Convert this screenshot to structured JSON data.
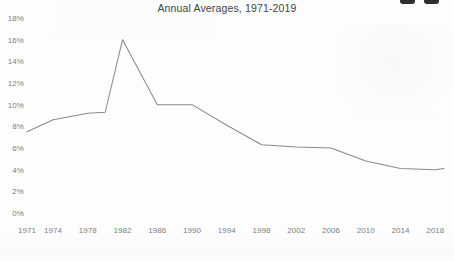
{
  "chart_data": {
    "type": "line",
    "title": "Annual Averages, 1971-2019",
    "xlabel": "",
    "ylabel": "",
    "ylim": [
      0,
      18
    ],
    "xlim": [
      1971,
      2019
    ],
    "grid": false,
    "legend": "none",
    "ytick_labels": [
      "0%",
      "2%",
      "4%",
      "6%",
      "8%",
      "10%",
      "12%",
      "14%",
      "16%",
      "18%"
    ],
    "ytick_values": [
      0,
      2,
      4,
      6,
      8,
      10,
      12,
      14,
      16,
      18
    ],
    "xtick_labels": [
      "1971",
      "1974",
      "1978",
      "1982",
      "1986",
      "1990",
      "1994",
      "1998",
      "2002",
      "2006",
      "2010",
      "2014",
      "2018"
    ],
    "xtick_values": [
      1971,
      1974,
      1978,
      1982,
      1986,
      1990,
      1994,
      1998,
      2002,
      2006,
      2010,
      2014,
      2018
    ],
    "series": [
      {
        "name": "Annual Average",
        "color": "#8a8a8a",
        "x": [
          1971,
          1974,
          1978,
          1980,
          1982,
          1986,
          1990,
          1994,
          1998,
          2002,
          2006,
          2010,
          2014,
          2018,
          2019
        ],
        "values": [
          7.5,
          8.6,
          9.2,
          9.3,
          16.0,
          10.0,
          10.0,
          8.1,
          6.3,
          6.1,
          6.0,
          4.8,
          4.1,
          4.0,
          4.1
        ]
      }
    ]
  },
  "decor": {
    "corner_mark_1": "corner-mark",
    "corner_mark_2": "corner-mark"
  }
}
